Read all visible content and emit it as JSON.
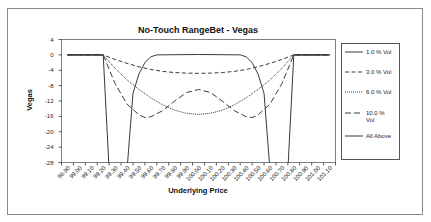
{
  "chart_data": {
    "type": "line",
    "title": "No-Touch RangeBet - Vegas",
    "xlabel": "Underlying Price",
    "ylabel": "Vegas",
    "ylim": [
      -28,
      4
    ],
    "yticks": [
      "4",
      "0",
      "-4",
      "-8",
      "-12",
      "-16",
      "-20",
      "-24",
      "-28"
    ],
    "ytick_values": [
      4,
      0,
      -4,
      -8,
      -12,
      -16,
      -20,
      -24,
      -28
    ],
    "categories": [
      "98.90",
      "99.00",
      "99.10",
      "99.20",
      "99.30",
      "99.40",
      "99.50",
      "99.60",
      "99.70",
      "99.80",
      "99.90",
      "100.00",
      "100.10",
      "100.20",
      "100.30",
      "100.40",
      "100.50",
      "100.60",
      "100.70",
      "100.80",
      "100.90",
      "101.00",
      "101.10"
    ],
    "xlim": [
      98.9,
      101.1
    ],
    "grid": false,
    "legend_position": "right",
    "series": [
      {
        "name": "1.0 % Vol",
        "style": "solid",
        "points": [
          [
            98.9,
            0
          ],
          [
            99.2,
            0
          ],
          [
            99.25,
            -30
          ],
          [
            99.4,
            -30
          ],
          [
            99.45,
            -10
          ],
          [
            99.5,
            -5
          ],
          [
            99.55,
            -2
          ],
          [
            99.6,
            -0.5
          ],
          [
            99.65,
            0
          ],
          [
            100.0,
            0.1
          ],
          [
            100.35,
            0
          ],
          [
            100.4,
            -0.5
          ],
          [
            100.45,
            -2
          ],
          [
            100.5,
            -5
          ],
          [
            100.55,
            -10
          ],
          [
            100.6,
            -30
          ],
          [
            100.75,
            -30
          ],
          [
            100.8,
            0
          ],
          [
            101.1,
            0
          ]
        ]
      },
      {
        "name": "3.0 % Vol",
        "style": "dashed",
        "points": [
          [
            98.9,
            0
          ],
          [
            99.2,
            0
          ],
          [
            99.3,
            -1.2
          ],
          [
            99.4,
            -2.2
          ],
          [
            99.5,
            -3.1
          ],
          [
            99.6,
            -3.8
          ],
          [
            99.7,
            -4.3
          ],
          [
            99.8,
            -4.6
          ],
          [
            99.9,
            -4.75
          ],
          [
            100.0,
            -4.8
          ],
          [
            100.1,
            -4.75
          ],
          [
            100.2,
            -4.6
          ],
          [
            100.3,
            -4.3
          ],
          [
            100.4,
            -3.8
          ],
          [
            100.5,
            -3.1
          ],
          [
            100.6,
            -2.2
          ],
          [
            100.7,
            -1.2
          ],
          [
            100.8,
            0
          ],
          [
            101.1,
            0
          ]
        ]
      },
      {
        "name": "6.0 % Vol",
        "style": "dotted",
        "points": [
          [
            98.9,
            0
          ],
          [
            99.2,
            0
          ],
          [
            99.3,
            -3.5
          ],
          [
            99.4,
            -6.5
          ],
          [
            99.5,
            -9.0
          ],
          [
            99.6,
            -11.2
          ],
          [
            99.7,
            -13.0
          ],
          [
            99.8,
            -14.4
          ],
          [
            99.9,
            -15.2
          ],
          [
            100.0,
            -15.5
          ],
          [
            100.1,
            -15.2
          ],
          [
            100.2,
            -14.4
          ],
          [
            100.3,
            -13.0
          ],
          [
            100.4,
            -11.2
          ],
          [
            100.5,
            -9.0
          ],
          [
            100.6,
            -6.5
          ],
          [
            100.7,
            -3.5
          ],
          [
            100.8,
            0
          ],
          [
            101.1,
            0
          ]
        ]
      },
      {
        "name": "10.0 % Vol",
        "style": "dashdot",
        "points": [
          [
            98.9,
            0
          ],
          [
            99.2,
            0
          ],
          [
            99.3,
            -7.5
          ],
          [
            99.4,
            -12.8
          ],
          [
            99.5,
            -15.6
          ],
          [
            99.55,
            -16.3
          ],
          [
            99.6,
            -16.1
          ],
          [
            99.7,
            -14.5
          ],
          [
            99.8,
            -12.0
          ],
          [
            99.9,
            -9.8
          ],
          [
            100.0,
            -9.0
          ],
          [
            100.1,
            -9.8
          ],
          [
            100.2,
            -12.0
          ],
          [
            100.3,
            -14.5
          ],
          [
            100.4,
            -16.1
          ],
          [
            100.45,
            -16.3
          ],
          [
            100.5,
            -15.6
          ],
          [
            100.6,
            -12.8
          ],
          [
            100.7,
            -7.5
          ],
          [
            100.8,
            0
          ],
          [
            101.1,
            0
          ]
        ]
      },
      {
        "name": "All Above",
        "style": "solid-bold",
        "points": [
          [
            98.9,
            0
          ],
          [
            99.2,
            0
          ]
        ],
        "points_right": [
          [
            100.8,
            0
          ],
          [
            101.1,
            0
          ]
        ]
      }
    ]
  }
}
